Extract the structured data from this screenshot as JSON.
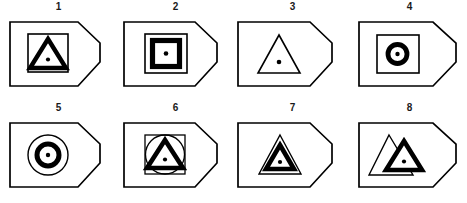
{
  "plate": {
    "title": "Numbered outline-shape figure plate",
    "background_color": "#ffffff",
    "ink_color": "#000000",
    "figure_count": 8,
    "columns": 4,
    "rows": 2,
    "frame_shape": "pentagon-arrow-tag"
  },
  "figures": [
    {
      "number": "1",
      "label": "1",
      "frame": "pentagon-arrow-tag",
      "contents": "thin outline square containing a thick filled triangle ring with a center dot",
      "inner_shapes": [
        "square-outline",
        "triangle-thick-ring",
        "center-dot"
      ]
    },
    {
      "number": "2",
      "label": "2",
      "frame": "pentagon-arrow-tag",
      "contents": "thin outline square containing a thick filled square ring with a center dot",
      "inner_shapes": [
        "square-outline",
        "square-thick-ring",
        "center-dot"
      ]
    },
    {
      "number": "3",
      "label": "3",
      "frame": "pentagon-arrow-tag",
      "contents": "thin outline triangle with a center dot",
      "inner_shapes": [
        "triangle-outline",
        "center-dot"
      ]
    },
    {
      "number": "4",
      "label": "4",
      "frame": "pentagon-arrow-tag",
      "contents": "thin outline square containing a thick filled circle ring with a center dot",
      "inner_shapes": [
        "square-outline",
        "circle-thick-ring",
        "center-dot"
      ]
    },
    {
      "number": "5",
      "label": "5",
      "frame": "pentagon-arrow-tag",
      "contents": "thin outline circle containing a thick filled circle ring with a center dot",
      "inner_shapes": [
        "circle-outline",
        "circle-thick-ring",
        "center-dot"
      ]
    },
    {
      "number": "6",
      "label": "6",
      "frame": "pentagon-arrow-tag",
      "contents": "thin outline square with inscribed thin circle containing a thick filled triangle ring with a center dot",
      "inner_shapes": [
        "square-outline",
        "circle-outline",
        "triangle-thick-ring",
        "center-dot"
      ]
    },
    {
      "number": "7",
      "label": "7",
      "frame": "pentagon-arrow-tag",
      "contents": "thin outline triangle containing a concentric thick filled triangle ring with a center dot",
      "inner_shapes": [
        "triangle-outline",
        "triangle-thick-ring",
        "center-dot"
      ]
    },
    {
      "number": "8",
      "label": "8",
      "frame": "pentagon-arrow-tag",
      "contents": "thin outline triangle overlapped by an offset thick filled triangle ring with a center dot",
      "inner_shapes": [
        "triangle-outline",
        "triangle-thick-ring-offset",
        "center-dot"
      ]
    }
  ]
}
